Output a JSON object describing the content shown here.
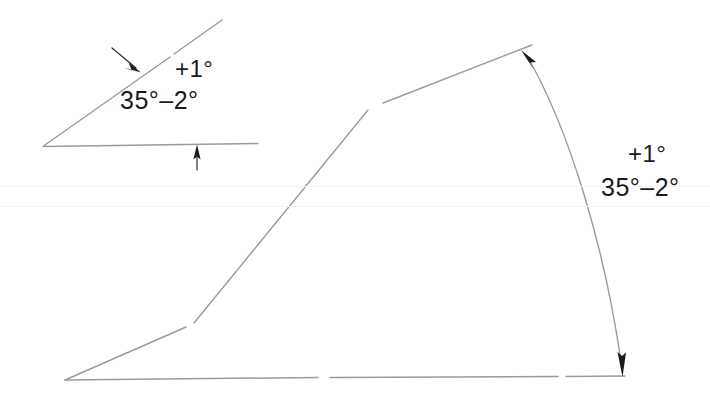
{
  "drawing": {
    "title": "Angular tolerance comparison drawing",
    "background_color": "#ffffff",
    "line_color": "#8d8d93",
    "arrow_color": "#1b1b1b",
    "text_color": "#1b1b1b",
    "small_angle": {
      "name": "small-angle-figure",
      "vertex": "43,146",
      "nominal_label": "35°–2°",
      "tolerance_upper_label": "+1°",
      "nominal_value": 35,
      "tolerance_plus": 1,
      "tolerance_minus": 2,
      "units": "degrees",
      "leader_arrow_inclined": "arrow-down-right",
      "leader_arrow_horizontal": "arrow-up"
    },
    "large_angle": {
      "name": "large-angle-figure",
      "vertex": "65,380",
      "nominal_label": "35°–2°",
      "tolerance_upper_label": "+1°",
      "nominal_value": 35,
      "tolerance_plus": 1,
      "tolerance_minus": 2,
      "units": "degrees",
      "arc_radius": 560,
      "arc_start_arrow": "arrow-up-left",
      "arc_end_arrow": "arrow-down"
    }
  }
}
